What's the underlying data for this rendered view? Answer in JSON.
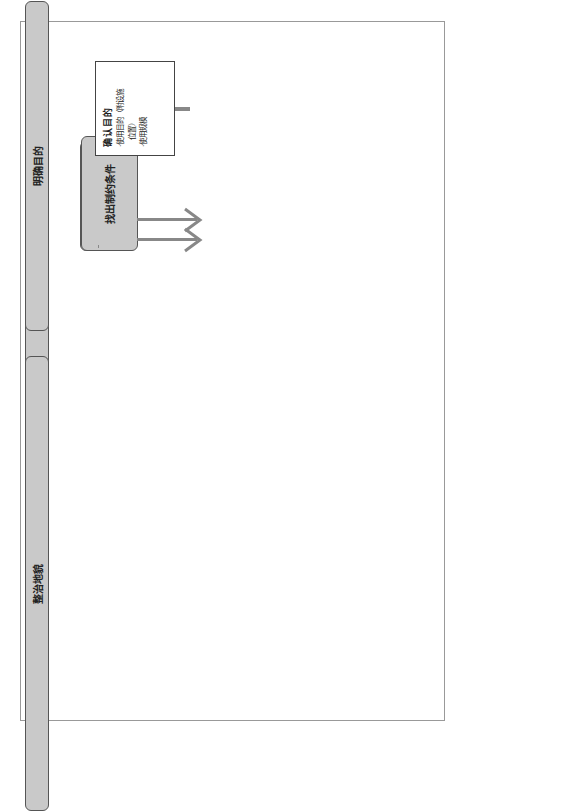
{
  "figure": {
    "caption": "图 6.1 草坪场地建造探讨流程图"
  },
  "stages": {
    "clarify_purpose": "明确目的",
    "site_grading": "整治地貌",
    "find_constraints": "找出制约条件",
    "work_flow": "作业流程"
  },
  "confirm_purpose": {
    "title": "确认目的",
    "items": [
      "·使用目的（附设施",
      "　位置）",
      "·使用规模"
    ]
  },
  "planning_conditions": {
    "title": "整理规划条件",
    "items": [
      "·立地场所（地域性）",
      "　的条件",
      "·气候条件、土壤条件",
      "·成本条件",
      "·建设费、养护管理费",
      "·施工计划",
      "·养护管理计划"
    ]
  },
  "purpose_match": {
    "label": "合乎目的",
    "back": "后退",
    "forward": "前进"
  },
  "field_test": {
    "title": "实 地 验 证 试 验",
    "items": [
      "施工确认试验",
      "材料选择试验",
      "确认养护管理是否合理试验"
    ]
  },
  "design": {
    "title": "设　计",
    "items": [
      "草坪场地内的设计",
      "·草坪的设计",
      "·植被基盘的设计",
      "·排水设施的设计",
      "·灌水设施的设计",
      "·草坪保护设施的设计",
      "·环境控制设施的设计",
      "草坪场地外的设计",
      "·管理设施的设计",
      "·草坪草养护设施(苗圃)的",
      "　设计"
    ]
  },
  "construction": {
    "title": "施　　工",
    "items": [
      "施工计划",
      "·施工计划",
      "·工程计划",
      "·临时设施计划",
      "质量管理",
      "·质量管理",
      "·成形管理",
      "·交工条件",
      "安全管理"
    ]
  },
  "maintenance": {
    "title": "养 护 管 理",
    "items": [
      "经营管理计划",
      "·制定经营体制",
      "·制定使用计划",
      "·制定管理方法(管理体制)",
      "养护管理计划",
      "·日常管理作业",
      "·更新作业",
      "·补休作业生长",
      "·特殊形态的调查计划",
      "·调查环境情况",
      "·调查草坪生长情况",
      "·调查植被基盘土壤",
      "·调查一些特殊形状"
    ]
  },
  "coordination": {
    "line1": "协商・调",
    "line2": "整作业"
  },
  "surveys": [
    {
      "label": "调查表",
      "num": "①"
    },
    {
      "label": "调查表",
      "num": "②"
    },
    {
      "label": "调查表",
      "num": "③"
    },
    {
      "label": "调查表",
      "num": "④"
    }
  ],
  "colors": {
    "pill_fill": "#c9c9c9",
    "arrow_gray": "#888888",
    "band_fill": "#c8c8c8",
    "line": "#111111"
  }
}
